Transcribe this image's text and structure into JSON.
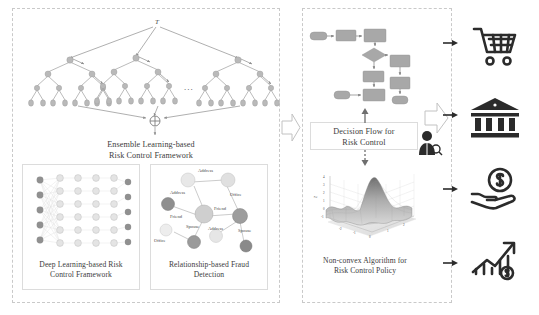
{
  "figure": {
    "left_panel": {
      "name": "models-panel",
      "ensemble": {
        "caption_line1": "Ensemble Learning-based",
        "caption_line2": "Risk Control Framework",
        "root_label": "T",
        "ellipsis": "...",
        "combine_symbol": "⊕",
        "tree_count": 3,
        "node_color": "#b9b9b9",
        "edge_color": "#8d8d8d"
      },
      "deep_learning": {
        "caption_line1": "Deep Learning-based Risk",
        "caption_line2": "Control Framework",
        "layers": [
          5,
          6,
          6,
          6,
          6,
          5
        ],
        "input_node_color": "#909090",
        "hidden_node_color": "#d8d8d8",
        "output_node_color": "#909090"
      },
      "relationship": {
        "caption_line1": "Relationship-based Fraud",
        "caption_line2": "Detection",
        "edge_labels": [
          "Address",
          "Address",
          "Office",
          "Friend",
          "Friend",
          "Spouse",
          "Spouse",
          "Address",
          "Office"
        ],
        "nodes": [
          "A",
          "B",
          "C",
          "D",
          "E",
          "F",
          "G",
          "H",
          "I"
        ]
      }
    },
    "transition_arrow": {
      "name": "left-to-right-arrow",
      "symbol": "block-arrow-right"
    },
    "right_panel": {
      "name": "policy-panel",
      "decision_flow": {
        "caption_line1": "Decision Flow for",
        "caption_line2": "Risk Control"
      },
      "non_convex": {
        "caption_line1": "Non-convex Algorithm for",
        "caption_line2": "Risk Control Policy",
        "axis_ticks_z": [
          "4",
          "3",
          "2",
          "1",
          "0",
          "-1"
        ],
        "axis_ticks_x": [
          "-2",
          "-1",
          "0",
          "1",
          "2"
        ],
        "axis_ticks_y": [
          "-2",
          "-1",
          "0",
          "1",
          "2"
        ]
      },
      "analyst_icon": "person-magnifier-icon",
      "output_arrow": "block-arrow-right"
    },
    "applications": [
      {
        "name": "e-commerce",
        "icon": "shopping-cart-icon"
      },
      {
        "name": "banking",
        "icon": "bank-icon"
      },
      {
        "name": "lending",
        "icon": "hand-coin-icon"
      },
      {
        "name": "investment",
        "icon": "growth-chart-dollar-icon"
      }
    ],
    "colors": {
      "dashed_border": "#c9c9c9",
      "box_border": "#dcdcdc",
      "flow_fill": "#a8a8a8",
      "text": "#3c3c3c",
      "icon": "#2b2b2b"
    }
  }
}
